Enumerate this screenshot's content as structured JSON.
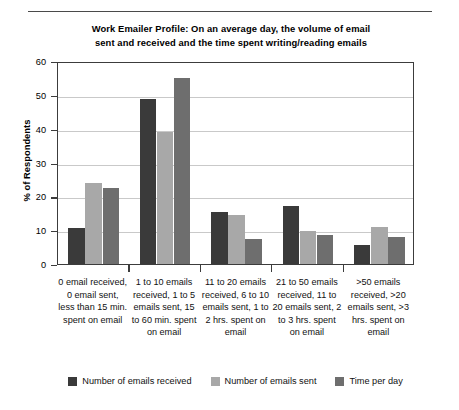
{
  "chart_data": {
    "type": "bar",
    "title": "Work Emailer Profile: On an average day, the volume of email sent and received and the time spent writing/reading emails",
    "title_line1": "Work Emailer Profile: On an average day, the volume of email",
    "title_line2": "sent and received and the time spent writing/reading emails",
    "xlabel": "",
    "ylabel": "% of Respondents",
    "ylim": [
      0,
      60
    ],
    "ytick_step": 10,
    "yticks": [
      0,
      10,
      20,
      30,
      40,
      50,
      60
    ],
    "ytick_labels": [
      "0",
      "10",
      "20",
      "30",
      "40",
      "50",
      "60"
    ],
    "grid": true,
    "legend_position": "bottom",
    "categories": [
      "0 email received, 0 email sent, less than 15 min. spent on email",
      "1 to 10 emails received, 1 to 5 emails sent, 15 to 60 min. spent on email",
      "11 to 20 emails received, 6 to 10 emails sent, 1 to 2 hrs. spent on email",
      "21 to 50 emails received, 11 to 20 emails sent, 2 to 3 hrs. spent on email",
      ">50 emails received, >20 emails sent, >3 hrs. spent on email"
    ],
    "series": [
      {
        "name": "Number of emails received",
        "color": "#3a3a3a",
        "values": [
          10.5,
          48.8,
          15.5,
          17.0,
          5.5
        ]
      },
      {
        "name": "Number of emails sent",
        "color": "#a8a8a8",
        "values": [
          24.0,
          39.0,
          14.5,
          9.8,
          11.0
        ]
      },
      {
        "name": "Time per day",
        "color": "#6e6e6e",
        "values": [
          22.5,
          55.0,
          7.5,
          8.7,
          8.0
        ]
      }
    ]
  }
}
